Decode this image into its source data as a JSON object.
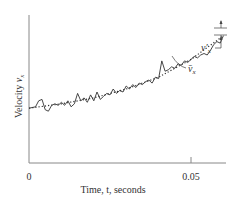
{
  "chart_data": {
    "type": "line",
    "title": "",
    "xlabel": "Time, t, seconds",
    "ylabel": "Velocity v_x",
    "x_ticks": [
      {
        "value": 0,
        "label": "0"
      },
      {
        "value": 0.05,
        "label": "0.05"
      }
    ],
    "xlim": [
      0,
      0.061
    ],
    "ylim": [
      0,
      1
    ],
    "grid": false,
    "legend": null,
    "series": [
      {
        "name": "v_x (instantaneous, turbulent)",
        "style": "solid",
        "x": [
          0.0,
          0.002,
          0.003,
          0.004,
          0.005,
          0.006,
          0.007,
          0.008,
          0.009,
          0.01,
          0.011,
          0.012,
          0.013,
          0.014,
          0.015,
          0.016,
          0.017,
          0.018,
          0.019,
          0.02,
          0.021,
          0.022,
          0.023,
          0.024,
          0.025,
          0.026,
          0.027,
          0.028,
          0.029,
          0.03,
          0.031,
          0.032,
          0.033,
          0.034,
          0.035,
          0.036,
          0.037,
          0.038,
          0.039,
          0.04,
          0.041,
          0.042,
          0.043,
          0.044,
          0.045,
          0.046,
          0.047,
          0.048,
          0.049,
          0.05,
          0.051,
          0.052,
          0.053,
          0.054,
          0.055,
          0.056,
          0.057,
          0.058,
          0.059,
          0.06
        ],
        "y": [
          0.37,
          0.38,
          0.42,
          0.43,
          0.36,
          0.35,
          0.39,
          0.4,
          0.39,
          0.41,
          0.39,
          0.42,
          0.38,
          0.4,
          0.47,
          0.42,
          0.44,
          0.41,
          0.46,
          0.42,
          0.48,
          0.43,
          0.45,
          0.47,
          0.46,
          0.5,
          0.47,
          0.49,
          0.48,
          0.52,
          0.5,
          0.53,
          0.51,
          0.54,
          0.53,
          0.55,
          0.56,
          0.54,
          0.58,
          0.57,
          0.69,
          0.62,
          0.63,
          0.65,
          0.64,
          0.67,
          0.66,
          0.69,
          0.68,
          0.7,
          0.72,
          0.71,
          0.73,
          0.74,
          0.73,
          0.76,
          0.8,
          0.82,
          0.81,
          0.86
        ]
      },
      {
        "name": "v̄_x (time-smoothed mean)",
        "style": "dotted",
        "x": [
          0.0,
          0.01,
          0.02,
          0.03,
          0.04,
          0.05,
          0.06
        ],
        "y": [
          0.37,
          0.4,
          0.44,
          0.5,
          0.58,
          0.7,
          0.86
        ]
      }
    ],
    "annotations": [
      {
        "text": "v̄_x",
        "target": "mean curve",
        "at_x": 0.044
      },
      {
        "text": "v′_x",
        "target": "fluctuation about mean",
        "at_x": 0.059
      }
    ]
  },
  "labels": {
    "xlabel": "Time, t, seconds",
    "ylabel_text": "Velocity ",
    "ylabel_var": "v",
    "ylabel_sub": "x",
    "tick0": "0",
    "tick1": "0.05",
    "annot_mean_var": "v̄",
    "annot_mean_sub": "x",
    "annot_fluct_var": "v′",
    "annot_fluct_sub": "x"
  }
}
